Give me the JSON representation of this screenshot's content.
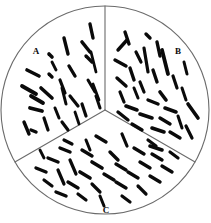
{
  "figure": {
    "width": 211,
    "height": 223,
    "background_color": "#ffffff",
    "outline_color": "#6b6b6b",
    "cell_color": "#0a0a0a"
  },
  "plate": {
    "center_x": 105,
    "center_y": 110,
    "radius": 104,
    "divider_angles_deg": [
      90,
      210,
      330
    ]
  },
  "sectors": [
    {
      "id": "A",
      "label": "A",
      "label_x": 36,
      "label_y": 54,
      "position": "upper-left",
      "cell_count": 27
    },
    {
      "id": "B",
      "label": "B",
      "label_x": 178,
      "label_y": 54,
      "position": "upper-right",
      "cell_count": 31
    },
    {
      "id": "C",
      "label": "C",
      "label_x": 106,
      "label_y": 213,
      "position": "bottom",
      "cell_count": 33
    }
  ],
  "cells": {
    "sector_a": [
      {
        "x1": 90,
        "y1": 24,
        "x2": 93,
        "y2": 38,
        "w": 3.4
      },
      {
        "x1": 64,
        "y1": 38,
        "x2": 68,
        "y2": 54,
        "w": 3.4
      },
      {
        "x1": 82,
        "y1": 42,
        "x2": 90,
        "y2": 52,
        "w": 3.6
      },
      {
        "x1": 49,
        "y1": 54,
        "x2": 52,
        "y2": 57,
        "w": 3.6
      },
      {
        "x1": 86,
        "y1": 56,
        "x2": 92,
        "y2": 62,
        "w": 3.4
      },
      {
        "x1": 91,
        "y1": 52,
        "x2": 96,
        "y2": 72,
        "w": 2.8
      },
      {
        "x1": 69,
        "y1": 66,
        "x2": 75,
        "y2": 76,
        "w": 3.4
      },
      {
        "x1": 49,
        "y1": 74,
        "x2": 52,
        "y2": 77,
        "w": 3.4
      },
      {
        "x1": 27,
        "y1": 70,
        "x2": 39,
        "y2": 76,
        "w": 3.6
      },
      {
        "x1": 60,
        "y1": 80,
        "x2": 65,
        "y2": 93,
        "w": 3.2
      },
      {
        "x1": 88,
        "y1": 80,
        "x2": 95,
        "y2": 92,
        "w": 3.0
      },
      {
        "x1": 22,
        "y1": 86,
        "x2": 36,
        "y2": 94,
        "w": 3.8
      },
      {
        "x1": 41,
        "y1": 88,
        "x2": 52,
        "y2": 98,
        "w": 3.6
      },
      {
        "x1": 93,
        "y1": 84,
        "x2": 99,
        "y2": 100,
        "w": 2.8
      },
      {
        "x1": 62,
        "y1": 88,
        "x2": 66,
        "y2": 104,
        "w": 3.0
      },
      {
        "x1": 31,
        "y1": 96,
        "x2": 43,
        "y2": 103,
        "w": 3.8
      },
      {
        "x1": 70,
        "y1": 96,
        "x2": 78,
        "y2": 106,
        "w": 3.2
      },
      {
        "x1": 96,
        "y1": 96,
        "x2": 100,
        "y2": 108,
        "w": 3.0
      },
      {
        "x1": 30,
        "y1": 108,
        "x2": 42,
        "y2": 111,
        "w": 3.8
      },
      {
        "x1": 82,
        "y1": 104,
        "x2": 86,
        "y2": 116,
        "w": 3.2
      },
      {
        "x1": 55,
        "y1": 108,
        "x2": 59,
        "y2": 118,
        "w": 3.0
      },
      {
        "x1": 24,
        "y1": 122,
        "x2": 29,
        "y2": 134,
        "w": 3.4
      },
      {
        "x1": 44,
        "y1": 118,
        "x2": 48,
        "y2": 130,
        "w": 3.2
      },
      {
        "x1": 62,
        "y1": 122,
        "x2": 68,
        "y2": 130,
        "w": 3.2
      },
      {
        "x1": 31,
        "y1": 130,
        "x2": 36,
        "y2": 132,
        "w": 3.4
      },
      {
        "x1": 75,
        "y1": 112,
        "x2": 79,
        "y2": 124,
        "w": 2.8
      },
      {
        "x1": 52,
        "y1": 62,
        "x2": 56,
        "y2": 70,
        "w": 2.8
      }
    ],
    "sector_b": [
      {
        "x1": 125,
        "y1": 32,
        "x2": 129,
        "y2": 44,
        "w": 3.4
      },
      {
        "x1": 146,
        "y1": 34,
        "x2": 150,
        "y2": 38,
        "w": 3.4
      },
      {
        "x1": 118,
        "y1": 50,
        "x2": 127,
        "y2": 40,
        "w": 3.4
      },
      {
        "x1": 157,
        "y1": 42,
        "x2": 160,
        "y2": 56,
        "w": 3.4
      },
      {
        "x1": 136,
        "y1": 52,
        "x2": 141,
        "y2": 62,
        "w": 3.2
      },
      {
        "x1": 144,
        "y1": 48,
        "x2": 148,
        "y2": 72,
        "w": 3.2
      },
      {
        "x1": 162,
        "y1": 50,
        "x2": 168,
        "y2": 74,
        "w": 3.8
      },
      {
        "x1": 115,
        "y1": 60,
        "x2": 126,
        "y2": 66,
        "w": 3.4
      },
      {
        "x1": 184,
        "y1": 62,
        "x2": 187,
        "y2": 74,
        "w": 3.0
      },
      {
        "x1": 130,
        "y1": 68,
        "x2": 134,
        "y2": 80,
        "w": 3.4
      },
      {
        "x1": 153,
        "y1": 70,
        "x2": 157,
        "y2": 82,
        "w": 3.4
      },
      {
        "x1": 173,
        "y1": 76,
        "x2": 177,
        "y2": 88,
        "w": 3.2
      },
      {
        "x1": 117,
        "y1": 78,
        "x2": 126,
        "y2": 86,
        "w": 3.4
      },
      {
        "x1": 140,
        "y1": 82,
        "x2": 144,
        "y2": 92,
        "w": 3.2
      },
      {
        "x1": 120,
        "y1": 92,
        "x2": 124,
        "y2": 102,
        "w": 3.2
      },
      {
        "x1": 134,
        "y1": 88,
        "x2": 138,
        "y2": 98,
        "w": 3.0
      },
      {
        "x1": 160,
        "y1": 92,
        "x2": 166,
        "y2": 100,
        "w": 3.6
      },
      {
        "x1": 182,
        "y1": 88,
        "x2": 186,
        "y2": 100,
        "w": 3.0
      },
      {
        "x1": 126,
        "y1": 106,
        "x2": 137,
        "y2": 110,
        "w": 3.6
      },
      {
        "x1": 148,
        "y1": 100,
        "x2": 158,
        "y2": 104,
        "w": 3.4
      },
      {
        "x1": 165,
        "y1": 108,
        "x2": 176,
        "y2": 112,
        "w": 3.6
      },
      {
        "x1": 188,
        "y1": 104,
        "x2": 198,
        "y2": 118,
        "w": 3.6
      },
      {
        "x1": 118,
        "y1": 112,
        "x2": 128,
        "y2": 120,
        "w": 3.4
      },
      {
        "x1": 140,
        "y1": 114,
        "x2": 152,
        "y2": 118,
        "w": 3.6
      },
      {
        "x1": 160,
        "y1": 118,
        "x2": 170,
        "y2": 124,
        "w": 3.4
      },
      {
        "x1": 178,
        "y1": 116,
        "x2": 182,
        "y2": 128,
        "w": 3.0
      },
      {
        "x1": 132,
        "y1": 124,
        "x2": 142,
        "y2": 130,
        "w": 3.4
      },
      {
        "x1": 152,
        "y1": 128,
        "x2": 164,
        "y2": 132,
        "w": 3.6
      },
      {
        "x1": 170,
        "y1": 132,
        "x2": 180,
        "y2": 138,
        "w": 3.4
      },
      {
        "x1": 186,
        "y1": 126,
        "x2": 192,
        "y2": 138,
        "w": 3.2
      },
      {
        "x1": 150,
        "y1": 146,
        "x2": 162,
        "y2": 150,
        "w": 3.6
      }
    ],
    "sector_c": [
      {
        "x1": 96,
        "y1": 136,
        "x2": 106,
        "y2": 142,
        "w": 3.4
      },
      {
        "x1": 122,
        "y1": 134,
        "x2": 127,
        "y2": 146,
        "w": 3.2
      },
      {
        "x1": 60,
        "y1": 148,
        "x2": 70,
        "y2": 152,
        "w": 3.4
      },
      {
        "x1": 82,
        "y1": 150,
        "x2": 92,
        "y2": 156,
        "w": 3.4
      },
      {
        "x1": 110,
        "y1": 152,
        "x2": 118,
        "y2": 160,
        "w": 3.4
      },
      {
        "x1": 134,
        "y1": 148,
        "x2": 144,
        "y2": 154,
        "w": 3.4
      },
      {
        "x1": 152,
        "y1": 154,
        "x2": 162,
        "y2": 160,
        "w": 3.4
      },
      {
        "x1": 48,
        "y1": 158,
        "x2": 58,
        "y2": 162,
        "w": 3.4
      },
      {
        "x1": 70,
        "y1": 160,
        "x2": 76,
        "y2": 174,
        "w": 3.2
      },
      {
        "x1": 92,
        "y1": 162,
        "x2": 102,
        "y2": 168,
        "w": 3.6
      },
      {
        "x1": 116,
        "y1": 164,
        "x2": 126,
        "y2": 170,
        "w": 3.4
      },
      {
        "x1": 140,
        "y1": 162,
        "x2": 150,
        "y2": 168,
        "w": 3.4
      },
      {
        "x1": 162,
        "y1": 166,
        "x2": 172,
        "y2": 172,
        "w": 3.4
      },
      {
        "x1": 36,
        "y1": 168,
        "x2": 46,
        "y2": 172,
        "w": 3.4
      },
      {
        "x1": 58,
        "y1": 170,
        "x2": 64,
        "y2": 184,
        "w": 3.2
      },
      {
        "x1": 80,
        "y1": 172,
        "x2": 90,
        "y2": 178,
        "w": 3.6
      },
      {
        "x1": 104,
        "y1": 174,
        "x2": 114,
        "y2": 180,
        "w": 3.4
      },
      {
        "x1": 128,
        "y1": 172,
        "x2": 138,
        "y2": 178,
        "w": 3.4
      },
      {
        "x1": 150,
        "y1": 176,
        "x2": 160,
        "y2": 182,
        "w": 3.4
      },
      {
        "x1": 44,
        "y1": 180,
        "x2": 52,
        "y2": 186,
        "w": 3.2
      },
      {
        "x1": 68,
        "y1": 182,
        "x2": 78,
        "y2": 188,
        "w": 3.4
      },
      {
        "x1": 92,
        "y1": 184,
        "x2": 100,
        "y2": 192,
        "w": 3.2
      },
      {
        "x1": 116,
        "y1": 182,
        "x2": 126,
        "y2": 188,
        "w": 3.4
      },
      {
        "x1": 138,
        "y1": 186,
        "x2": 146,
        "y2": 194,
        "w": 3.2
      },
      {
        "x1": 56,
        "y1": 192,
        "x2": 66,
        "y2": 196,
        "w": 3.4
      },
      {
        "x1": 78,
        "y1": 194,
        "x2": 86,
        "y2": 200,
        "w": 3.2
      },
      {
        "x1": 100,
        "y1": 196,
        "x2": 104,
        "y2": 206,
        "w": 3.0
      },
      {
        "x1": 122,
        "y1": 196,
        "x2": 130,
        "y2": 202,
        "w": 3.2
      },
      {
        "x1": 86,
        "y1": 140,
        "x2": 90,
        "y2": 150,
        "w": 3.0
      },
      {
        "x1": 148,
        "y1": 140,
        "x2": 156,
        "y2": 146,
        "w": 3.2
      },
      {
        "x1": 64,
        "y1": 140,
        "x2": 72,
        "y2": 144,
        "w": 3.2
      },
      {
        "x1": 40,
        "y1": 150,
        "x2": 44,
        "y2": 158,
        "w": 2.8
      },
      {
        "x1": 170,
        "y1": 152,
        "x2": 178,
        "y2": 158,
        "w": 3.2
      }
    ]
  }
}
